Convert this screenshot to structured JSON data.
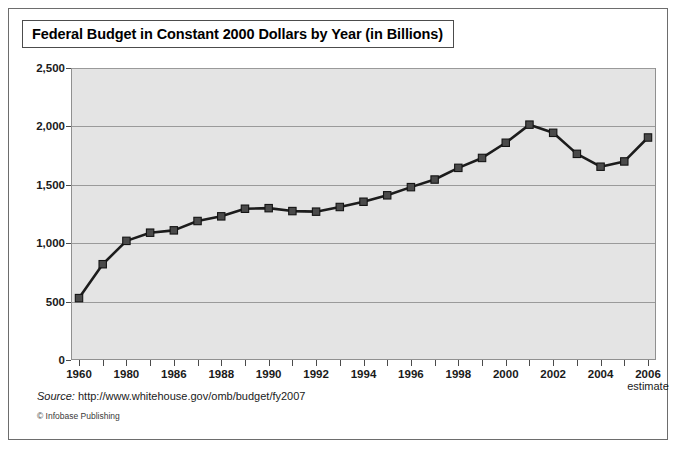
{
  "figure": {
    "title": "Federal Budget in Constant 2000 Dollars by Year (in Billions)",
    "source_label": "Source:",
    "source_url": "http://www.whitehouse.gov/omb/budget/fy2007",
    "copyright": "© Infobase Publishing"
  },
  "chart_data": {
    "type": "line",
    "title": "Federal Budget in Constant 2000 Dollars by Year (in Billions)",
    "xlabel": "",
    "ylabel": "",
    "ylim": [
      0,
      2500
    ],
    "yticks": [
      0,
      500,
      1000,
      1500,
      2000,
      2500
    ],
    "ytick_labels": [
      "0",
      "500",
      "1,000",
      "1,500",
      "2,000",
      "2,500"
    ],
    "grid": true,
    "legend": false,
    "marker": "square",
    "line_color": "#1c1c1c",
    "marker_color": "#4a4a4a",
    "plot_background": "#e4e4e4",
    "x": [
      "1960",
      "1970",
      "1980",
      "1984",
      "1986",
      "1987",
      "1988",
      "1989",
      "1990",
      "1991",
      "1992",
      "1993",
      "1994",
      "1995",
      "1996",
      "1997",
      "1998",
      "1999",
      "2000",
      "2001",
      "2002",
      "2003",
      "2004",
      "2005",
      "2006"
    ],
    "xtick_labels": [
      "1960",
      "",
      "1980",
      "",
      "1986",
      "",
      "1988",
      "",
      "1990",
      "",
      "1992",
      "",
      "1994",
      "",
      "1996",
      "",
      "1998",
      "",
      "2000",
      "",
      "2002",
      "",
      "2004",
      "",
      "2006"
    ],
    "last_tick_sublabel": "estimate",
    "values": [
      530,
      820,
      1020,
      1090,
      1110,
      1190,
      1230,
      1295,
      1300,
      1275,
      1270,
      1310,
      1355,
      1410,
      1480,
      1545,
      1645,
      1730,
      1860,
      2015,
      1945,
      1765,
      1655,
      1700,
      1905
    ],
    "series": [
      {
        "name": "Federal Budget (constant 2000 dollars, billions)",
        "values": [
          530,
          820,
          1020,
          1090,
          1110,
          1190,
          1230,
          1295,
          1300,
          1275,
          1270,
          1310,
          1355,
          1410,
          1480,
          1545,
          1645,
          1730,
          1860,
          2015,
          1945,
          1765,
          1655,
          1700,
          1905
        ]
      }
    ],
    "final_point_value": 1940
  }
}
